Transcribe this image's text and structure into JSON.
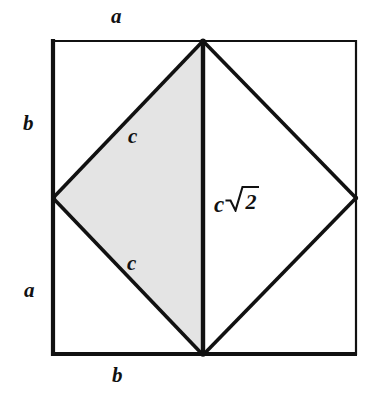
{
  "figure": {
    "labels": {
      "top_side": "a",
      "bottom_side": "b",
      "left_upper_side": "b",
      "left_lower_side": "a",
      "upper_hypotenuse": "c",
      "lower_hypotenuse": "c",
      "diagonal_c": "c",
      "diagonal_radicand": "2"
    },
    "colors": {
      "stroke": "#111111",
      "shaded_fill": "#e4e4e4",
      "background": "#ffffff"
    },
    "geometry": {
      "square": {
        "left": 52,
        "top": 40,
        "right": 357,
        "bottom": 355
      },
      "diamond_vertices": {
        "top": [
          203,
          41
        ],
        "right": [
          356,
          198
        ],
        "bottom": [
          203,
          355
        ],
        "left": [
          53,
          198
        ]
      },
      "shaded_polygon": [
        [
          203,
          41
        ],
        [
          53,
          198
        ],
        [
          203,
          355
        ]
      ]
    }
  }
}
